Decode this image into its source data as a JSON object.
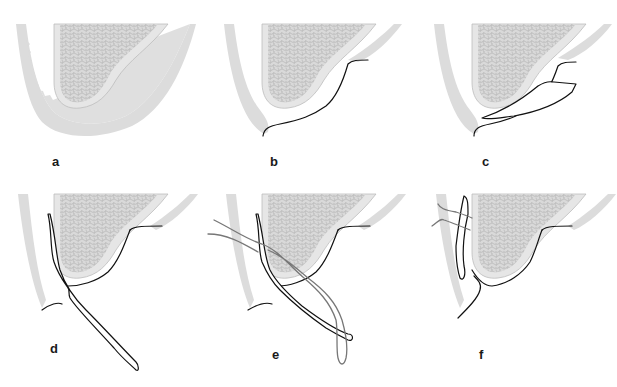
{
  "figure": {
    "background": "#ffffff",
    "colors": {
      "gingiva": "#dcdcdc",
      "bone_cortex": "#e6e6e6",
      "bone_spongy": "#c8c8c8",
      "incision_line": "#111111",
      "suture": "#777777"
    },
    "panels": [
      {
        "label": "a",
        "content": "Intact bone and soft tissue"
      },
      {
        "label": "b",
        "content": "Incision line"
      },
      {
        "label": "c",
        "content": "Flap elevated / split"
      },
      {
        "label": "d",
        "content": "Flap reflected"
      },
      {
        "label": "e",
        "content": "Flap with suture threads"
      },
      {
        "label": "f",
        "content": "Flap sutured in place"
      }
    ]
  }
}
